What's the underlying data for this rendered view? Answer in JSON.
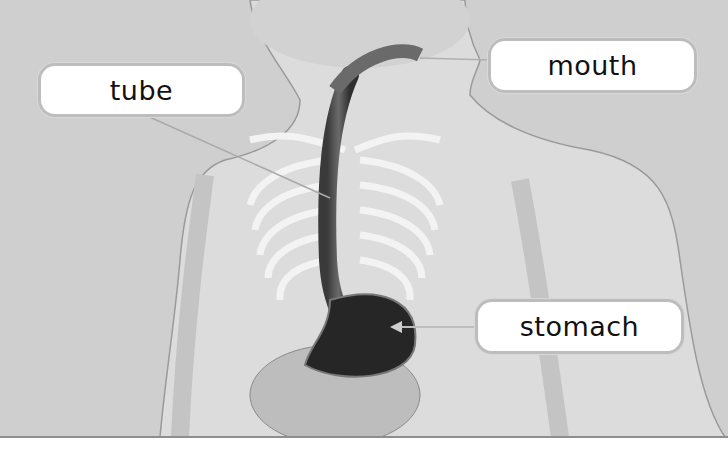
{
  "diagram": {
    "labels": [
      {
        "id": "tube",
        "text": "tube",
        "points_to": "esophagus"
      },
      {
        "id": "mouth",
        "text": "mouth",
        "points_to": "mouth"
      },
      {
        "id": "stomach",
        "text": "stomach",
        "points_to": "stomach"
      }
    ]
  },
  "colors": {
    "background": "#cfcfcf",
    "body_fill": "#dedede",
    "bone": "#f4f4f4",
    "organ_dark": "#2a2a2a",
    "label_bg": "#ffffff",
    "label_text": "#111111"
  }
}
